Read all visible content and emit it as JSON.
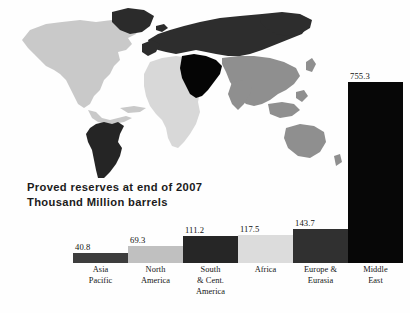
{
  "figure": {
    "caption_lines": [
      "Proved reserves at end of 2007",
      "Thousand Million barrels"
    ]
  },
  "map": {
    "regions": [
      {
        "name": "north-america",
        "shade": "#c9c9c9"
      },
      {
        "name": "greenland",
        "shade": "#2b2b2b"
      },
      {
        "name": "south-america",
        "shade": "#252525"
      },
      {
        "name": "africa",
        "shade": "#d8d8d8"
      },
      {
        "name": "europe-eurasia",
        "shade": "#2d2d2d"
      },
      {
        "name": "middle-east",
        "shade": "#050505"
      },
      {
        "name": "asia-pacific",
        "shade": "#8f8f8f"
      },
      {
        "name": "australia",
        "shade": "#8f8f8f"
      }
    ]
  },
  "chart_data": {
    "type": "bar",
    "title": "Proved reserves at end of 2007",
    "subtitle": "Thousand Million barrels",
    "xlabel": "",
    "ylabel": "Thousand Million barrels",
    "ylim": [
      0,
      800
    ],
    "grid": false,
    "legend": "none",
    "categories": [
      "Asia Pacific",
      "North America",
      "South & Cent. America",
      "Africa",
      "Europe & Eurasia",
      "Middle East"
    ],
    "category_label_lines": [
      [
        "Asia",
        "Pacific"
      ],
      [
        "North",
        "America"
      ],
      [
        "South",
        "& Cent.",
        "America"
      ],
      [
        "Africa"
      ],
      [
        "Europe &",
        "Eurasia"
      ],
      [
        "Middle",
        "East"
      ]
    ],
    "values": [
      40.8,
      69.3,
      111.2,
      117.5,
      143.7,
      755.3
    ],
    "value_labels": [
      "40.8",
      "69.3",
      "111.2",
      "117.5",
      "143.7",
      "755.3"
    ],
    "bar_colors": [
      "#3d3d3d",
      "#c0c0c0",
      "#262626",
      "#dcdcdc",
      "#303030",
      "#070707"
    ]
  }
}
